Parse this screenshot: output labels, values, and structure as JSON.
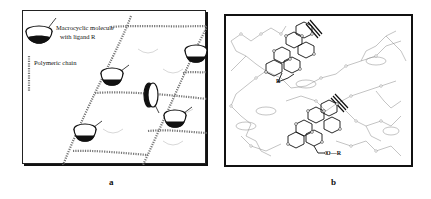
{
  "figure": {
    "panels": [
      {
        "id": "a",
        "caption": "a",
        "legend": {
          "macrocycle_label_line1": "Macrocyclic molecule",
          "macrocycle_label_line2": "with ligand R",
          "chain_label": "Polymeric chain",
          "ligand_symbol": "R"
        }
      },
      {
        "id": "b",
        "caption": "b",
        "ligand_labels": [
          "R",
          "O—R"
        ]
      }
    ]
  },
  "colors": {
    "line": "#111111",
    "chain": "#555555",
    "faint": "#cfcfcf",
    "background": "#ffffff"
  }
}
